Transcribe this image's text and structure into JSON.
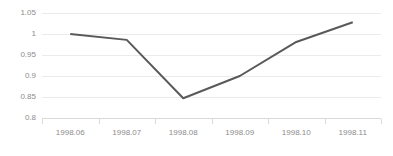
{
  "chart_data": {
    "type": "line",
    "title": "",
    "subtitle": "",
    "xlabel": "",
    "ylabel": "",
    "categories": [
      "1998.06",
      "1998.07",
      "1998.08",
      "1998.09",
      "1998.10",
      "1998.11"
    ],
    "values": [
      1.0,
      0.986,
      0.847,
      0.9,
      0.981,
      1.028
    ],
    "series": [
      {
        "name": "",
        "values": [
          1.0,
          0.986,
          0.847,
          0.9,
          0.981,
          1.028
        ]
      }
    ],
    "ylim": [
      0.8,
      1.05
    ],
    "ytick_labels": [
      "1.05",
      "1",
      "0.95",
      "0.9",
      "0.85",
      "0.8"
    ],
    "ytick_values": [
      1.05,
      1.0,
      0.95,
      0.9,
      0.85,
      0.8
    ],
    "xtick_labels": [
      "1998.06",
      "1998.07",
      "1998.08",
      "1998.09",
      "1998.10",
      "1998.11"
    ],
    "grid": true,
    "grid_axis": "y",
    "legend": false,
    "legend_position": "none",
    "colors": {
      "line": "#595959",
      "gridline": "#ebebeb",
      "axis": "#d9d9d9",
      "tick_text": "#8c8c8c",
      "background": "#ffffff"
    }
  }
}
